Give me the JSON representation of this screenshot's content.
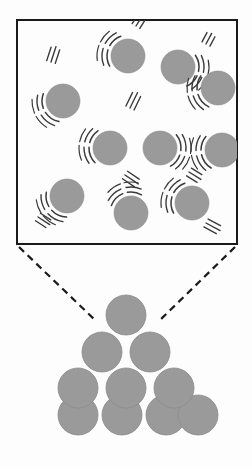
{
  "figure": {
    "background_color": "#fdfdfd",
    "width": 252,
    "height": 469
  },
  "style": {
    "particle_fill": "#9a9a9a",
    "particle_stroke": "#8c8c8c",
    "box_stroke": "#1a1a1a",
    "box_fill": "#fdfdfd",
    "motion_line_color": "#3a3a3a",
    "leader_line_color": "#1a1a1a",
    "box_stroke_width": 2,
    "leader_dash": "7 5",
    "leader_width": 2.2
  },
  "magnified_box": {
    "name": "magnified-view-box",
    "x": 17,
    "y": 20,
    "width": 220,
    "height": 224,
    "particle_radius": 17,
    "particles": [
      {
        "id": 1,
        "cx": 128,
        "cy": 56,
        "arc_angle": 200,
        "speed_lines": [
          {
            "x": 136,
            "y": 26,
            "angle": -58,
            "count": 3,
            "len": 13
          }
        ]
      },
      {
        "id": 2,
        "cx": 178,
        "cy": 67,
        "arc_angle": 15,
        "speed_lines": [
          {
            "x": 206,
            "y": 44,
            "angle": -62,
            "count": 3,
            "len": 12
          }
        ]
      },
      {
        "id": 3,
        "cx": 218,
        "cy": 88,
        "arc_angle": 165,
        "speed_lines": []
      },
      {
        "id": 4,
        "cx": 63,
        "cy": 101,
        "arc_angle": 150,
        "speed_lines": [
          {
            "x": 51,
            "y": 62,
            "angle": -72,
            "count": 3,
            "len": 16
          }
        ]
      },
      {
        "id": 5,
        "cx": 110,
        "cy": 148,
        "arc_angle": 185,
        "speed_lines": [
          {
            "x": 130,
            "y": 108,
            "angle": -64,
            "count": 3,
            "len": 17
          }
        ]
      },
      {
        "id": 6,
        "cx": 160,
        "cy": 148,
        "arc_angle": 10,
        "speed_lines": [
          {
            "x": 125,
            "y": 175,
            "angle": 34,
            "count": 3,
            "len": 16
          }
        ]
      },
      {
        "id": 7,
        "cx": 222,
        "cy": 150,
        "arc_angle": 170,
        "speed_lines": [
          {
            "x": 189,
            "y": 172,
            "angle": 32,
            "count": 3,
            "len": 14
          }
        ]
      },
      {
        "id": 8,
        "cx": 67,
        "cy": 196,
        "arc_angle": 140,
        "speed_lines": [
          {
            "x": 38,
            "y": 217,
            "angle": 33,
            "count": 3,
            "len": 14
          }
        ]
      },
      {
        "id": 9,
        "cx": 131,
        "cy": 213,
        "arc_angle": 250,
        "speed_lines": []
      },
      {
        "id": 10,
        "cx": 192,
        "cy": 203,
        "arc_angle": 200,
        "speed_lines": [
          {
            "x": 206,
            "y": 223,
            "angle": 28,
            "count": 3,
            "len": 16
          }
        ]
      }
    ],
    "particle_count": 10,
    "description": "Particles in random motion with motion arcs and speed lines"
  },
  "leader_lines": [
    {
      "name": "leader-line-left",
      "x1": 19,
      "y1": 247,
      "x2": 95,
      "y2": 320
    },
    {
      "name": "leader-line-right",
      "x1": 235,
      "y1": 247,
      "x2": 160,
      "y2": 320
    }
  ],
  "packed_structure": {
    "name": "close-packed-pyramid",
    "particle_radius": 20,
    "rows": [
      {
        "row": 1,
        "count": 1,
        "cy": 315,
        "centers": [
          126
        ]
      },
      {
        "row": 2,
        "count": 2,
        "cy": 352,
        "centers": [
          102,
          150
        ]
      },
      {
        "row": 3,
        "count": 3,
        "cy": 388,
        "centers": [
          78,
          126,
          174
        ]
      },
      {
        "row": 4,
        "count": 4,
        "cy": 415,
        "centers": [
          78,
          122,
          166,
          198
        ]
      }
    ],
    "particle_count": 10,
    "description": "Ordered close-packed triangular arrangement of particles"
  }
}
